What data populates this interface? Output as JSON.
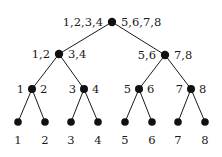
{
  "diagram": {
    "type": "binary-tree",
    "colors": {
      "ink": "#1a1a1a",
      "node": "#111111",
      "background": "#ffffff"
    },
    "nodes": [
      {
        "id": "root",
        "left_label": "1,2,3,4",
        "right_label": "5,6,7,8"
      },
      {
        "id": "n12_34",
        "parent": "root",
        "left_label": "1,2",
        "right_label": "3,4"
      },
      {
        "id": "n56_78",
        "parent": "root",
        "left_label": "5,6",
        "right_label": "7,8"
      },
      {
        "id": "n1_2",
        "parent": "n12_34",
        "left_label": "1",
        "right_label": "2"
      },
      {
        "id": "n3_4",
        "parent": "n12_34",
        "left_label": "3",
        "right_label": "4"
      },
      {
        "id": "n5_6",
        "parent": "n56_78",
        "left_label": "5",
        "right_label": "6"
      },
      {
        "id": "n7_8",
        "parent": "n56_78",
        "left_label": "7",
        "right_label": "8"
      },
      {
        "id": "leaf1",
        "parent": "n1_2",
        "label": "1"
      },
      {
        "id": "leaf2",
        "parent": "n1_2",
        "label": "2"
      },
      {
        "id": "leaf3",
        "parent": "n3_4",
        "label": "3"
      },
      {
        "id": "leaf4",
        "parent": "n3_4",
        "label": "4"
      },
      {
        "id": "leaf5",
        "parent": "n5_6",
        "label": "5"
      },
      {
        "id": "leaf6",
        "parent": "n5_6",
        "label": "6"
      },
      {
        "id": "leaf7",
        "parent": "n7_8",
        "label": "7"
      },
      {
        "id": "leaf8",
        "parent": "n7_8",
        "label": "8"
      }
    ]
  }
}
